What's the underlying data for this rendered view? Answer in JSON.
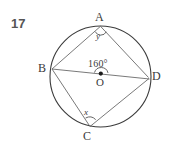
{
  "question": {
    "number": "17"
  },
  "figure": {
    "type": "circle-geometry-diagram",
    "center_label": "O",
    "points": [
      {
        "id": "A",
        "label": "A",
        "position": "top"
      },
      {
        "id": "B",
        "label": "B",
        "position": "left"
      },
      {
        "id": "C",
        "label": "C",
        "position": "bottom"
      },
      {
        "id": "D",
        "label": "D",
        "position": "right"
      }
    ],
    "angles": [
      {
        "id": "center",
        "label": "160°",
        "at": "O",
        "value": 160,
        "unit": "degrees"
      },
      {
        "id": "y",
        "label": "y",
        "at": "A",
        "value": null
      },
      {
        "id": "x",
        "label": "x",
        "at": "C",
        "value": null
      }
    ],
    "chords": [
      "B-A",
      "A-D",
      "B-C",
      "C-D",
      "B-D"
    ],
    "colors": {
      "stroke": "#555555",
      "circle_stroke": "#3c3c3c",
      "text": "#3a3a3a",
      "background": "#ffffff"
    }
  }
}
